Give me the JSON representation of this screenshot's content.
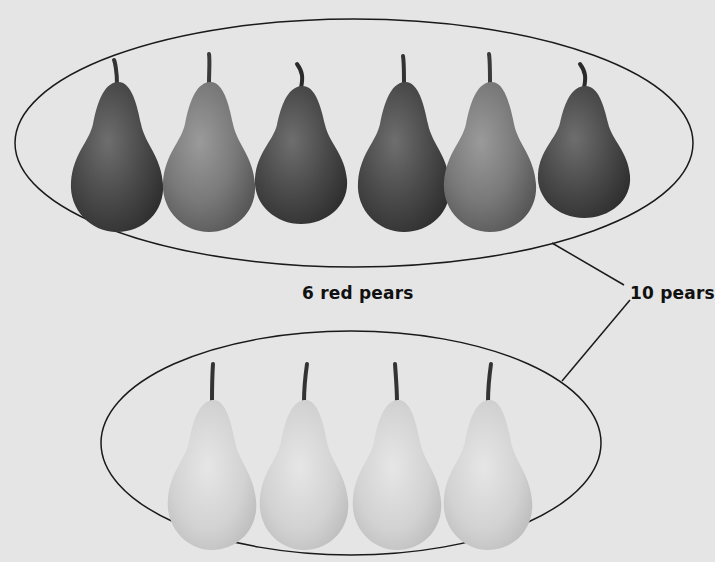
{
  "groups": {
    "red": {
      "label": "6 red pears",
      "count": 6,
      "pear_shades": [
        "dark",
        "medium",
        "dark",
        "dark",
        "medium",
        "dark"
      ]
    },
    "green": {
      "label": "",
      "count": 4,
      "pear_shades": [
        "light",
        "light",
        "light",
        "light"
      ]
    }
  },
  "total": {
    "label": "10 pears",
    "count": 10
  },
  "colors": {
    "background": "#e5e5e5",
    "outline": "#1a1a1a",
    "pear_dark": "#4a4a4a",
    "pear_medium": "#7a7a7a",
    "pear_light": "#d2d2d2",
    "stem": "#333333"
  }
}
